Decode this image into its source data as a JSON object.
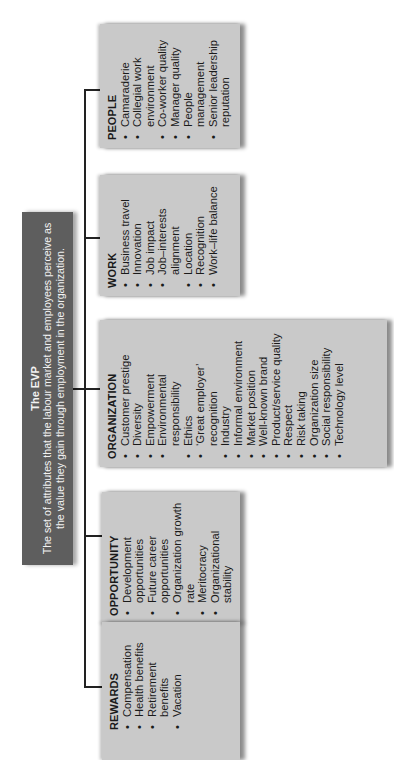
{
  "evp": {
    "title": "The EVP",
    "description": "The set of attributes that the labour market and employees perceive as the value they gain through employment in the organization.",
    "background_color": "#5e5e5e"
  },
  "categories": [
    {
      "id": "people",
      "title": "PEOPLE",
      "items": [
        "Camaraderie",
        "Collegial work environment",
        "Co-worker quality",
        "Manager quality",
        "People management",
        "Senior leadership reputation"
      ]
    },
    {
      "id": "work",
      "title": "WORK",
      "items": [
        "Business travel",
        "Innovation",
        "Job impact",
        "Job–interests alignment",
        "Location",
        "Recognition",
        "Work–life balance"
      ]
    },
    {
      "id": "organization",
      "title": "ORGANIZATION",
      "items": [
        "Customer prestige",
        "Diversity",
        "Empowerment",
        "Environmental responsibility",
        "Ethics",
        "‘Great employer’ recognition",
        "Industry",
        "Informal environment",
        "Market position",
        "Well-known brand",
        "Product/service quality",
        "Respect",
        "Risk taking",
        "Organization size",
        "Social responsibility",
        "Technology level"
      ]
    },
    {
      "id": "opportunity",
      "title": "OPPORTUNITY",
      "items": [
        "Development opportunities",
        "Future career opportunities",
        "Organization growth rate",
        "Meritocracy",
        "Organizational stability"
      ]
    },
    {
      "id": "rewards",
      "title": "REWARDS",
      "items": [
        "Compensation",
        "Health benefits",
        "Retirement benefits",
        "Vacation"
      ]
    }
  ],
  "colors": {
    "category_box": "#c9c9c9",
    "connector": "#222222"
  }
}
